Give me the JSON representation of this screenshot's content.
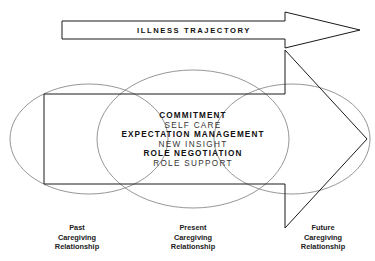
{
  "top_arrow": {
    "label": "ILLNESS TRAJECTORY"
  },
  "center_concepts": [
    {
      "text": "COMMITMENT",
      "style": "bold"
    },
    {
      "text": "SELF CARE",
      "style": "light"
    },
    {
      "text": "EXPECTATION MANAGEMENT",
      "style": "bold"
    },
    {
      "text": "NEW INSIGHT",
      "style": "light"
    },
    {
      "text": "ROLE NEGOTIATION",
      "style": "bold"
    },
    {
      "text": "ROLE SUPPORT",
      "style": "light"
    }
  ],
  "circle_labels": {
    "past": [
      "Past",
      "Caregiving",
      "Relationship"
    ],
    "present": [
      "Present",
      "Caregiving",
      "Relationship"
    ],
    "future": [
      "Future",
      "Caregiving",
      "Relationship"
    ]
  },
  "colors": {
    "arrow_stroke": "#1a1a1a",
    "circle_stroke": "#8a8a8a",
    "background": "#ffffff"
  }
}
